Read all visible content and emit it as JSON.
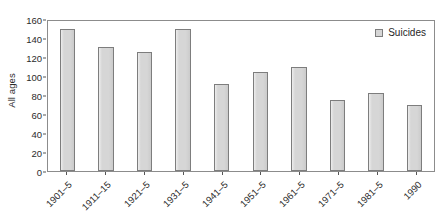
{
  "chart_data": {
    "type": "bar",
    "title": "",
    "subtitle": "",
    "xlabel": "",
    "ylabel": "All ages",
    "categories": [
      "1901–5",
      "1911–15",
      "1921–5",
      "1931–5",
      "1941–5",
      "1951–5",
      "1961–5",
      "1971–5",
      "1981–5",
      "1990"
    ],
    "values": [
      149,
      131,
      125,
      150,
      92,
      104,
      110,
      75,
      82,
      70
    ],
    "series": [
      {
        "name": "Suicides",
        "values": [
          149,
          131,
          125,
          150,
          92,
          104,
          110,
          75,
          82,
          70
        ]
      }
    ],
    "ylim": [
      0,
      160
    ],
    "yticks": [
      0,
      20,
      40,
      60,
      80,
      100,
      120,
      140,
      160
    ],
    "ytick_labels": [
      "0",
      "20",
      "40",
      "60",
      "80",
      "100",
      "120",
      "140",
      "160"
    ],
    "grid": false,
    "legend": {
      "position": "top-right",
      "entries": [
        "Suicides"
      ]
    },
    "colors": {
      "bar_fill": "#d6d6d6",
      "bar_border": "#7d7d7d",
      "axis": "#8c8c8c",
      "text": "#2b2b2b",
      "background": "#ffffff"
    },
    "xtick_rotation": -45
  }
}
